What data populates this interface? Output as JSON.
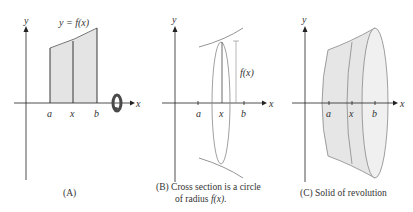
{
  "panels": {
    "a": {
      "axis_x_label": "x",
      "axis_y_label": "y",
      "curve_label": "y = f(x)",
      "tick_labels": [
        "a",
        "x",
        "b"
      ],
      "caption": "(A)",
      "rotation_icon": "rotation-arrow-icon"
    },
    "b": {
      "axis_x_label": "x",
      "axis_y_label": "y",
      "radius_label": "f(x)",
      "tick_labels": [
        "a",
        "x",
        "b"
      ],
      "caption_line1": "(B) Cross section is a circle",
      "caption_line2_prefix": "of radius ",
      "caption_line2_fx": "f(x)",
      "caption_line2_suffix": "."
    },
    "c": {
      "axis_x_label": "x",
      "axis_y_label": "y",
      "tick_labels": [
        "a",
        "x",
        "b"
      ],
      "caption": "(C) Solid of revolution"
    }
  },
  "colors": {
    "fill": "#e4e4e4",
    "stroke": "#222222",
    "light_stroke": "#888888",
    "rotation": "#4a4a4a"
  }
}
